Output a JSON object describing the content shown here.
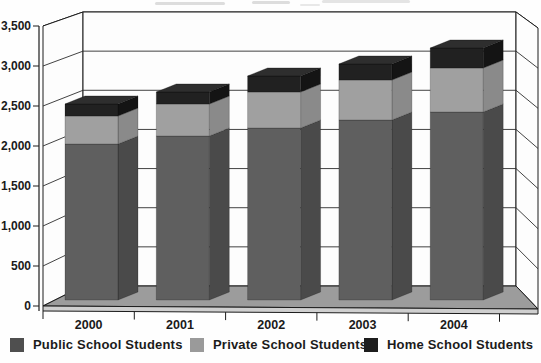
{
  "chart_data": {
    "type": "bar",
    "variant": "3d-stacked-column",
    "title": "",
    "xlabel": "",
    "ylabel": "",
    "categories": [
      "2000",
      "2001",
      "2002",
      "2003",
      "2004"
    ],
    "series": [
      {
        "name": "Public School Students",
        "values": [
          1950,
          2050,
          2150,
          2250,
          2350
        ],
        "color": "#5f5f5f",
        "side_color": "#4a4a4a",
        "top_color": "#6c6c6c",
        "legend_color": "#4f4f4f"
      },
      {
        "name": "Private School Students",
        "values": [
          350,
          400,
          450,
          500,
          550
        ],
        "color": "#a0a0a0",
        "side_color": "#8a8a8a",
        "top_color": "#b2b2b2",
        "legend_color": "#9a9a9a"
      },
      {
        "name": "Home School Students",
        "values": [
          150,
          150,
          200,
          200,
          250
        ],
        "color": "#212121",
        "side_color": "#141414",
        "top_color": "#2e2e2e",
        "legend_color": "#1d1d1d"
      }
    ],
    "stack_totals": [
      2450,
      2600,
      2800,
      2950,
      3150
    ],
    "ylim": [
      0,
      3500
    ],
    "ytick_step": 500,
    "ytick_labels": [
      "3,500",
      "3,000",
      "2,500",
      "2,000",
      "1,500",
      "1,000",
      "500",
      "0"
    ],
    "grid": true,
    "legend_position": "bottom"
  },
  "colors": {
    "wall": "#fdfdfd",
    "floor": "#9c9c9c",
    "floor_edge": "#cfcfcf",
    "frame_line": "#1c1c1c",
    "gridline": "#2e2e2e",
    "label": "#1a1a1a"
  }
}
